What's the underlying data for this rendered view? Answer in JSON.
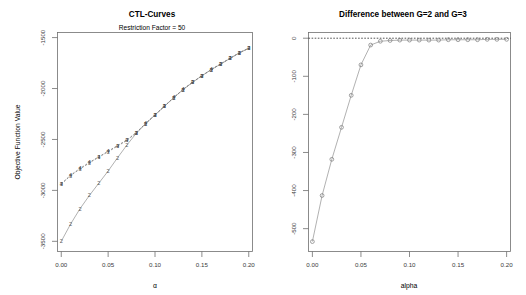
{
  "figure": {
    "width": 526,
    "height": 295,
    "background": "#ffffff",
    "panels": 2,
    "style": "R base graphics"
  },
  "chart_data": [
    {
      "panel": "left",
      "type": "line",
      "title": "CTL-Curves",
      "subtitle": "Restriction Factor = 50",
      "xlabel": "α",
      "ylabel": "Objective Function Value",
      "grid": false,
      "legend": "none",
      "xlim": [
        -0.004,
        0.204
      ],
      "ylim": [
        -3600,
        -1450
      ],
      "xticks": [
        0.0,
        0.05,
        0.1,
        0.15,
        0.2
      ],
      "xticklabels": [
        "0.00",
        "0.05",
        "0.10",
        "0.15",
        "0.20"
      ],
      "yticks": [
        -1500,
        -2000,
        -2500,
        -3000,
        -3500
      ],
      "yticklabels": [
        "-1500",
        "-2000",
        "-2500",
        "-3000",
        "-3500"
      ],
      "marker_style": "digit-glyph",
      "x": [
        0.0,
        0.01,
        0.02,
        0.03,
        0.04,
        0.05,
        0.06,
        0.07,
        0.08,
        0.09,
        0.1,
        0.11,
        0.12,
        0.13,
        0.14,
        0.15,
        0.16,
        0.17,
        0.18,
        0.19,
        0.2
      ],
      "series": [
        {
          "name": "G=2",
          "marker": "2",
          "linetype": "solid",
          "values": [
            -3500,
            -3330,
            -3180,
            -3050,
            -2930,
            -2810,
            -2680,
            -2555,
            -2440,
            -2345,
            -2260,
            -2175,
            -2090,
            -2010,
            -1940,
            -1875,
            -1815,
            -1760,
            -1705,
            -1650,
            -1605
          ]
        },
        {
          "name": "G=3",
          "marker": "3",
          "linetype": "dashed",
          "values": [
            -2940,
            -2855,
            -2790,
            -2730,
            -2675,
            -2620,
            -2565,
            -2510,
            -2435,
            -2345,
            -2260,
            -2175,
            -2090,
            -2010,
            -1940,
            -1875,
            -1815,
            -1760,
            -1705,
            -1650,
            -1605
          ]
        },
        {
          "name": "G=4",
          "marker": "4",
          "linetype": "dashed",
          "values": [
            -2935,
            -2850,
            -2785,
            -2725,
            -2670,
            -2615,
            -2560,
            -2505,
            -2432,
            -2343,
            -2258,
            -2173,
            -2088,
            -2008,
            -1938,
            -1873,
            -1813,
            -1758,
            -1703,
            -1648,
            -1603
          ]
        }
      ]
    },
    {
      "panel": "right",
      "type": "line",
      "title": "Difference between G=2 and G=3",
      "subtitle": "",
      "xlabel": "alpha",
      "ylabel": "",
      "grid": false,
      "legend": "none",
      "reference_line": {
        "y": 0,
        "style": "dotted"
      },
      "xlim": [
        -0.004,
        0.204
      ],
      "ylim": [
        -560,
        15
      ],
      "xticks": [
        0.0,
        0.05,
        0.1,
        0.15,
        0.2
      ],
      "xticklabels": [
        "0.00",
        "0.05",
        "0.10",
        "0.15",
        "0.20"
      ],
      "yticks": [
        0,
        -100,
        -200,
        -300,
        -400,
        -500
      ],
      "yticklabels": [
        "0",
        "-100",
        "-200",
        "-300",
        "-400",
        "-500"
      ],
      "marker_style": "open-circle",
      "x": [
        0.0,
        0.01,
        0.02,
        0.03,
        0.04,
        0.05,
        0.06,
        0.07,
        0.08,
        0.09,
        0.1,
        0.11,
        0.12,
        0.13,
        0.14,
        0.15,
        0.16,
        0.17,
        0.18,
        0.19,
        0.2
      ],
      "values": [
        -534,
        -413,
        -318,
        -234,
        -150,
        -70,
        -18,
        -8,
        -6,
        -5,
        -5,
        -5,
        -5,
        -5,
        -4,
        -4,
        -4,
        -4,
        -3,
        -3,
        -3
      ]
    }
  ],
  "left_panel": {
    "title": "CTL-Curves",
    "subtitle": "Restriction Factor = 50",
    "x_axis_label": "α",
    "y_axis_label": "Objective Function Value",
    "x_tick_labels": [
      "0.00",
      "0.05",
      "0.10",
      "0.15",
      "0.20"
    ],
    "y_tick_labels": [
      "-1500",
      "-2000",
      "-2500",
      "-3000",
      "-3500"
    ]
  },
  "right_panel": {
    "title": "Difference between G=2 and G=3",
    "x_axis_label": "alpha",
    "y_axis_label": "",
    "x_tick_labels": [
      "0.00",
      "0.05",
      "0.10",
      "0.15",
      "0.20"
    ],
    "y_tick_labels": [
      "0",
      "-100",
      "-200",
      "-300",
      "-400",
      "-500"
    ]
  },
  "colors": {
    "axis": "#6f6f6f",
    "text": "#000000",
    "tick_text": "#3a3a3a",
    "data_line": "#8f8f8f",
    "marker": "#5a5a5a",
    "zero_line": "#2a2a2a"
  }
}
